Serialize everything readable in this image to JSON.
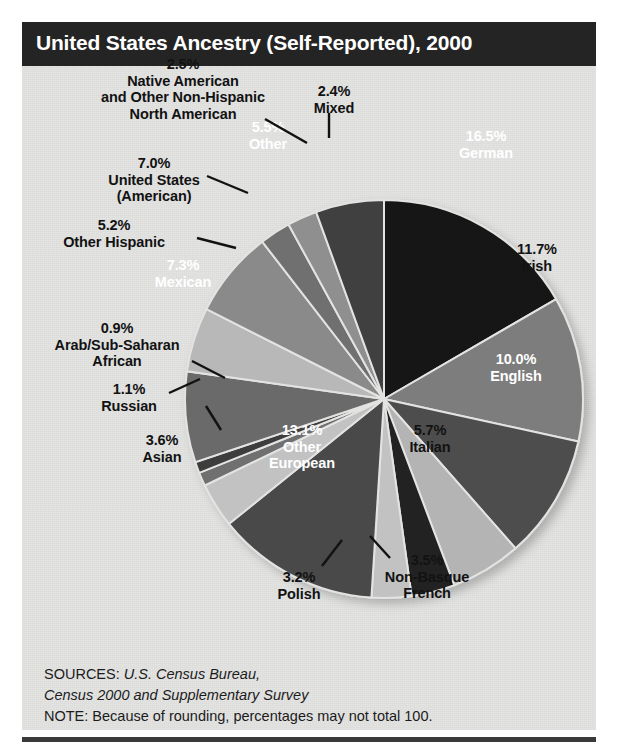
{
  "title": "United States Ancestry (Self-Reported), 2000",
  "footer": {
    "sources_prefix": "SOURCES: ",
    "sources_italic_1": "U.S. Census Bureau,",
    "sources_italic_2": "Census 2000 and Supplementary Survey",
    "note": "NOTE: Because of rounding, percentages may not total 100."
  },
  "colors": {
    "title_bar": "#242424",
    "panel_bg": "#e3e3e2",
    "black": "#151515",
    "near_black": "#232323",
    "dark_gray": "#4e4e4e",
    "mid_dark_gray": "#6a6a6a",
    "mid_gray": "#8a8a8a",
    "light_gray": "#b4b4b4",
    "lighter_gray": "#c8c8c8",
    "rule": "#3a3a3a"
  },
  "chart_data": {
    "type": "pie",
    "title": "United States Ancestry (Self-Reported), 2000",
    "unit": "percent",
    "total_label": "100",
    "start_angle_deg": 0,
    "direction": "clockwise",
    "categories": [
      "German",
      "Irish",
      "English",
      "Italian",
      "Non-Basque French",
      "Polish",
      "Other European",
      "Asian",
      "Russian",
      "Arab/Sub-Saharan African",
      "Mexican",
      "Other Hispanic",
      "United States (American)",
      "Native American and Other Non-Hispanic North American",
      "Mixed",
      "Other"
    ],
    "values": [
      16.5,
      11.7,
      10.0,
      5.7,
      3.5,
      3.2,
      13.1,
      3.6,
      1.1,
      0.9,
      7.3,
      5.2,
      7.0,
      2.5,
      2.4,
      5.5
    ],
    "slices": [
      {
        "label": "German",
        "percent": "16.5%",
        "value": 16.5,
        "fill": "#151515",
        "text_color": "#ffffff",
        "placement": "inside"
      },
      {
        "label": "Irish",
        "percent": "11.7%",
        "value": 11.7,
        "fill": "#7d7d7d",
        "text_color": "#121212",
        "placement": "inside"
      },
      {
        "label": "English",
        "percent": "10.0%",
        "value": 10.0,
        "fill": "#4e4e4e",
        "text_color": "#ffffff",
        "placement": "inside"
      },
      {
        "label": "Italian",
        "percent": "5.7%",
        "value": 5.7,
        "fill": "#b4b4b4",
        "text_color": "#121212",
        "placement": "inside"
      },
      {
        "label": "Non-Basque French",
        "percent": "3.5%",
        "value": 3.5,
        "fill": "#232323",
        "text_color": "#121212",
        "placement": "outside"
      },
      {
        "label": "Polish",
        "percent": "3.2%",
        "value": 3.2,
        "fill": "#c2c2c2",
        "text_color": "#121212",
        "placement": "outside"
      },
      {
        "label": "Other European",
        "percent": "13.1%",
        "value": 13.1,
        "fill": "#4a4a4a",
        "text_color": "#ffffff",
        "placement": "inside"
      },
      {
        "label": "Asian",
        "percent": "3.6%",
        "value": 3.6,
        "fill": "#c2c2c2",
        "text_color": "#121212",
        "placement": "outside"
      },
      {
        "label": "Russian",
        "percent": "1.1%",
        "value": 1.1,
        "fill": "#6f6f6f",
        "text_color": "#121212",
        "placement": "outside"
      },
      {
        "label": "Arab/Sub-Saharan African",
        "percent": "0.9%",
        "value": 0.9,
        "fill": "#3c3c3c",
        "text_color": "#121212",
        "placement": "outside"
      },
      {
        "label": "Mexican",
        "percent": "7.3%",
        "value": 7.3,
        "fill": "#6a6a6a",
        "text_color": "#ffffff",
        "placement": "inside"
      },
      {
        "label": "Other Hispanic",
        "percent": "5.2%",
        "value": 5.2,
        "fill": "#b8b8b8",
        "text_color": "#121212",
        "placement": "outside"
      },
      {
        "label": "United States (American)",
        "percent": "7.0%",
        "value": 7.0,
        "fill": "#8a8a8a",
        "text_color": "#121212",
        "placement": "outside"
      },
      {
        "label": "Native American and Other Non-Hispanic North American",
        "percent": "2.5%",
        "value": 2.5,
        "fill": "#6f6f6f",
        "text_color": "#121212",
        "placement": "outside"
      },
      {
        "label": "Mixed",
        "percent": "2.4%",
        "value": 2.4,
        "fill": "#8f8f8f",
        "text_color": "#121212",
        "placement": "outside"
      },
      {
        "label": "Other",
        "percent": "5.5%",
        "value": 5.5,
        "fill": "#3f3f3f",
        "text_color": "#ffffff",
        "placement": "inside"
      }
    ]
  },
  "labels": {
    "german": "16.5%\nGerman",
    "irish": "11.7%\nIrish",
    "english": "10.0%\nEnglish",
    "italian": "5.7%\nItalian",
    "non_basque_french": "3.5%\nNon-Basque\nFrench",
    "polish": "3.2%\nPolish",
    "other_european": "13.1%\nOther\nEuropean",
    "asian": "3.6%\nAsian",
    "russian": "1.1%\nRussian",
    "arab": "0.9%\nArab/Sub-Saharan\nAfrican",
    "mexican": "7.3%\nMexican",
    "other_hispanic": "5.2%\nOther Hispanic",
    "united_states": "7.0%\nUnited States\n(American)",
    "native_american": "2.5%\nNative American\nand Other Non-Hispanic\nNorth American",
    "mixed": "2.4%\nMixed",
    "other": "5.5%\nOther"
  }
}
